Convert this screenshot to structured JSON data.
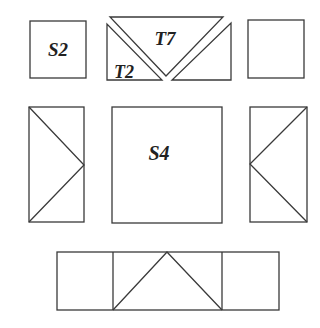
{
  "diagram": {
    "type": "tangram-pieces",
    "colors": {
      "stroke": "#3a3a3a",
      "label": "#222222",
      "background": "#ffffff"
    },
    "labels": {
      "s2": "S2",
      "t7": "T7",
      "t2": "T2",
      "s4": "S4"
    },
    "pieces": [
      {
        "id": "square-s2",
        "label": "S2",
        "shape": "square"
      },
      {
        "id": "triangle-t2",
        "label": "T2",
        "shape": "right-triangle"
      },
      {
        "id": "triangle-t7",
        "label": "T7",
        "shape": "inverted-triangle"
      },
      {
        "id": "triangle-right-small",
        "label": "",
        "shape": "right-triangle"
      },
      {
        "id": "square-top-right",
        "label": "",
        "shape": "square"
      },
      {
        "id": "rect-left-arrow",
        "label": "",
        "shape": "rectangle-with-chevron-right"
      },
      {
        "id": "square-s4",
        "label": "S4",
        "shape": "square"
      },
      {
        "id": "rect-right-arrow",
        "label": "",
        "shape": "rectangle-with-chevron-left"
      },
      {
        "id": "bottom-strip",
        "label": "",
        "shape": "rectangle-three-cells-with-triangle"
      }
    ]
  }
}
